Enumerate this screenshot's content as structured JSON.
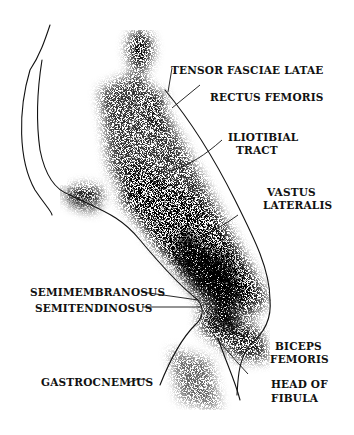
{
  "figure": {
    "ink_color": "#111111",
    "background_color": "#ffffff"
  },
  "labels": {
    "tensor_fasciae_latae": "TENSOR FASCIAE LATAE",
    "rectus_femoris": "RECTUS FEMORIS",
    "iliotibial_line1": "ILIOTIBIAL",
    "iliotibial_line2": "TRACT",
    "vastus_line1": "VASTUS",
    "vastus_line2": "LATERALIS",
    "semimembranosus": "SEMIMEMBRANOSUS",
    "semitendinosus": "SEMITENDINOSUS",
    "biceps_line1": "BICEPS",
    "biceps_line2": "FEMORIS",
    "gastrocnemius": "GASTROCNEMIUS",
    "head_line1": "HEAD OF",
    "head_line2": "FIBULA"
  }
}
